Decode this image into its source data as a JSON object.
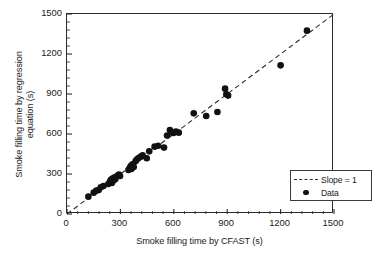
{
  "chart_data": {
    "type": "scatter",
    "title": "",
    "xlabel": "Smoke filling time by CFAST (s)",
    "ylabel": "Smoke filling time by regression\nequation (s)",
    "xlim": [
      0,
      1500
    ],
    "ylim": [
      0,
      1500
    ],
    "xticks": [
      0,
      300,
      600,
      900,
      1200,
      1500
    ],
    "yticks": [
      0,
      300,
      600,
      900,
      1200,
      1500
    ],
    "xtick_labels": [
      "0",
      "300",
      "600",
      "900",
      "1200",
      "1500"
    ],
    "ytick_labels": [
      "0",
      "300",
      "600",
      "900",
      "1200",
      "1500"
    ],
    "minor_ticks_per_interval": 5,
    "grid": false,
    "legend_position": "lower-right-inside",
    "series": [
      {
        "name": "Slope = 1",
        "type": "line",
        "style": "dashed",
        "color": "#2b2b2b",
        "x": [
          0,
          1500
        ],
        "y": [
          0,
          1500
        ]
      },
      {
        "name": "Data",
        "type": "scatter",
        "marker": "filled-circle",
        "color": "#111111",
        "points": [
          [
            120,
            130
          ],
          [
            150,
            160
          ],
          [
            165,
            175
          ],
          [
            178,
            180
          ],
          [
            190,
            200
          ],
          [
            205,
            210
          ],
          [
            232,
            225
          ],
          [
            242,
            245
          ],
          [
            248,
            258
          ],
          [
            252,
            232
          ],
          [
            258,
            268
          ],
          [
            262,
            252
          ],
          [
            268,
            275
          ],
          [
            272,
            262
          ],
          [
            285,
            288
          ],
          [
            292,
            295
          ],
          [
            298,
            285
          ],
          [
            345,
            330
          ],
          [
            352,
            345
          ],
          [
            358,
            360
          ],
          [
            362,
            338
          ],
          [
            368,
            372
          ],
          [
            375,
            352
          ],
          [
            385,
            395
          ],
          [
            392,
            408
          ],
          [
            402,
            420
          ],
          [
            415,
            430
          ],
          [
            425,
            440
          ],
          [
            448,
            418
          ],
          [
            462,
            470
          ],
          [
            492,
            505
          ],
          [
            512,
            512
          ],
          [
            545,
            498
          ],
          [
            562,
            588
          ],
          [
            578,
            630
          ],
          [
            585,
            612
          ],
          [
            598,
            608
          ],
          [
            612,
            618
          ],
          [
            628,
            610
          ],
          [
            712,
            755
          ],
          [
            782,
            735
          ],
          [
            845,
            765
          ],
          [
            888,
            940
          ],
          [
            895,
            898
          ],
          [
            905,
            888
          ],
          [
            1200,
            1115
          ],
          [
            1348,
            1375
          ]
        ]
      }
    ]
  },
  "legend": {
    "items": [
      {
        "label": "Slope = 1",
        "key": "dashed-line"
      },
      {
        "label": "Data",
        "key": "filled-circle"
      }
    ]
  }
}
